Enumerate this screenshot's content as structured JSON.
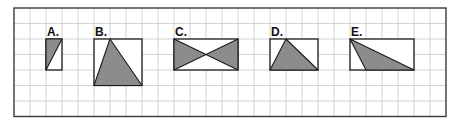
{
  "grid": {
    "left": 14,
    "top": 8,
    "cols": 27,
    "rows": 7,
    "cell_w": 16,
    "cell_h": 15.5,
    "line_color": "#c8c8c8",
    "border_color": "#3a3a3a"
  },
  "colors": {
    "shade": "#8c8c8c",
    "outline": "#1a1a1a",
    "background": "#ffffff"
  },
  "figures": [
    {
      "label": "A.",
      "rect": {
        "col": 2,
        "row": 2,
        "w": 1,
        "h": 2
      },
      "shaded": [
        [
          [
            0,
            0
          ],
          [
            1,
            0
          ],
          [
            0,
            2
          ]
        ]
      ]
    },
    {
      "label": "B.",
      "rect": {
        "col": 5,
        "row": 2,
        "w": 3,
        "h": 3
      },
      "shaded": [
        [
          [
            1,
            0
          ],
          [
            0,
            3
          ],
          [
            3,
            3
          ]
        ]
      ]
    },
    {
      "label": "C.",
      "rect": {
        "col": 10,
        "row": 2,
        "w": 4,
        "h": 2
      },
      "shaded": [
        [
          [
            0,
            0
          ],
          [
            2,
            1
          ],
          [
            0,
            2
          ]
        ],
        [
          [
            4,
            0
          ],
          [
            2,
            1
          ],
          [
            4,
            2
          ]
        ]
      ]
    },
    {
      "label": "D.",
      "rect": {
        "col": 16,
        "row": 2,
        "w": 3,
        "h": 2
      },
      "shaded": [
        [
          [
            1,
            0
          ],
          [
            0,
            2
          ],
          [
            3,
            2
          ]
        ]
      ]
    },
    {
      "label": "E.",
      "rect": {
        "col": 21,
        "row": 2,
        "w": 4,
        "h": 2
      },
      "shaded": [
        [
          [
            0,
            0
          ],
          [
            1,
            2
          ],
          [
            4,
            2
          ]
        ]
      ]
    }
  ]
}
